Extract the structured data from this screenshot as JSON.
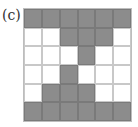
{
  "label": "(c)",
  "colors": {
    "filled": "#8c8c8c",
    "empty": "#ffffff",
    "line": "#c8c8c8"
  },
  "grid": {
    "rows": 6,
    "cols": 6,
    "cells": [
      [
        1,
        1,
        1,
        1,
        1,
        1
      ],
      [
        0,
        0,
        1,
        1,
        1,
        0
      ],
      [
        0,
        0,
        0,
        1,
        0,
        0
      ],
      [
        0,
        0,
        1,
        0,
        0,
        0
      ],
      [
        0,
        1,
        1,
        1,
        0,
        0
      ],
      [
        1,
        1,
        1,
        1,
        1,
        1
      ]
    ]
  }
}
